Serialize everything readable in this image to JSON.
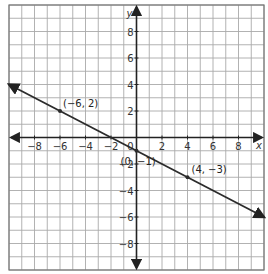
{
  "chart_data": {
    "type": "line",
    "title": "",
    "xlabel": "x",
    "ylabel": "y",
    "xlim": [
      -10,
      10
    ],
    "ylim": [
      -10,
      10
    ],
    "grid": true,
    "grid_step": 1,
    "x_ticks": [
      -8,
      -6,
      -4,
      -2,
      2,
      4,
      6,
      8
    ],
    "y_ticks": [
      -8,
      -6,
      -4,
      -2,
      2,
      4,
      6,
      8
    ],
    "x_tick_labels": [
      "−8",
      "−6",
      "−4",
      "−2",
      "2",
      "4",
      "6",
      "8"
    ],
    "y_tick_labels": [
      "−8",
      "−6",
      "−4",
      "−2",
      "2",
      "4",
      "6",
      "8"
    ],
    "origin_label": "0",
    "series": [
      {
        "name": "line",
        "equation": "y = -1/2 x - 1",
        "slope": -0.5,
        "intercept": -1,
        "x": [
          -10,
          10
        ],
        "y": [
          4,
          -6
        ],
        "arrows": "both"
      }
    ],
    "points": [
      {
        "x": -6,
        "y": 2,
        "label": "(−6, 2)"
      },
      {
        "x": 0,
        "y": -1,
        "label": "(0, −1)"
      },
      {
        "x": 4,
        "y": -3,
        "label": "(4, −3)"
      }
    ],
    "legend": null
  },
  "colors": {
    "grid": "#a9a9a9",
    "axis": "#222222",
    "line": "#2b2b2b",
    "text": "#333333",
    "background": "#ffffff"
  }
}
